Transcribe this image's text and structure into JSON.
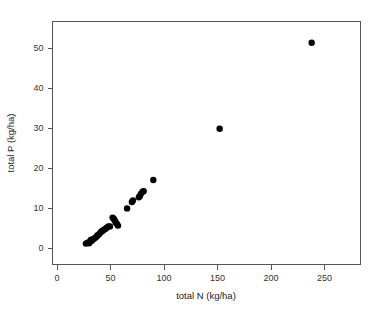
{
  "chart_data": {
    "type": "scatter",
    "title": "",
    "xlabel": "total N (kg/ha)",
    "ylabel": "total P (kg/ha)",
    "xlim": [
      0,
      270
    ],
    "ylim": [
      -2.5,
      58
    ],
    "xticks": [
      0,
      50,
      100,
      150,
      200,
      250
    ],
    "yticks": [
      0,
      10,
      20,
      30,
      40,
      50
    ],
    "xtick_labels": [
      "0",
      "50",
      "100",
      "150",
      "200",
      "250"
    ],
    "ytick_labels": [
      "0",
      "10",
      "20",
      "30",
      "40",
      "50"
    ],
    "grid": false,
    "legend": null,
    "marker": "filled-circle",
    "marker_color": "#000000",
    "marker_size": 3.2,
    "frame": "box",
    "points": [
      {
        "x": 27.0,
        "y": 1.1
      },
      {
        "x": 28.5,
        "y": 1.3
      },
      {
        "x": 30.0,
        "y": 1.2
      },
      {
        "x": 31.0,
        "y": 1.6
      },
      {
        "x": 31.5,
        "y": 2.0
      },
      {
        "x": 32.5,
        "y": 1.8
      },
      {
        "x": 33.5,
        "y": 2.2
      },
      {
        "x": 34.5,
        "y": 2.3
      },
      {
        "x": 36.0,
        "y": 2.6
      },
      {
        "x": 37.0,
        "y": 2.9
      },
      {
        "x": 38.0,
        "y": 3.2
      },
      {
        "x": 39.5,
        "y": 3.5
      },
      {
        "x": 41.0,
        "y": 4.0
      },
      {
        "x": 42.0,
        "y": 4.2
      },
      {
        "x": 43.0,
        "y": 4.4
      },
      {
        "x": 44.0,
        "y": 4.6
      },
      {
        "x": 45.5,
        "y": 4.8
      },
      {
        "x": 46.5,
        "y": 5.1
      },
      {
        "x": 48.0,
        "y": 5.4
      },
      {
        "x": 49.5,
        "y": 5.4
      },
      {
        "x": 52.0,
        "y": 7.6
      },
      {
        "x": 53.0,
        "y": 7.3
      },
      {
        "x": 54.0,
        "y": 6.9
      },
      {
        "x": 55.0,
        "y": 6.4
      },
      {
        "x": 56.0,
        "y": 6.0
      },
      {
        "x": 57.0,
        "y": 5.6
      },
      {
        "x": 65.5,
        "y": 9.9
      },
      {
        "x": 70.0,
        "y": 11.5
      },
      {
        "x": 71.0,
        "y": 11.9
      },
      {
        "x": 76.5,
        "y": 12.7
      },
      {
        "x": 77.5,
        "y": 13.0
      },
      {
        "x": 78.5,
        "y": 13.6
      },
      {
        "x": 80.0,
        "y": 14.1
      },
      {
        "x": 81.0,
        "y": 14.2
      },
      {
        "x": 90.0,
        "y": 17.0
      },
      {
        "x": 152.0,
        "y": 29.8
      },
      {
        "x": 238.0,
        "y": 51.3
      }
    ]
  },
  "axes": {
    "x_title": "total N (kg/ha)",
    "y_title": "total P (kg/ha)"
  }
}
